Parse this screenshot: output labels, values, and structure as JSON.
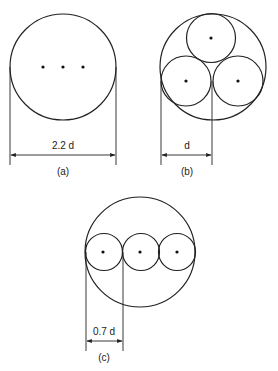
{
  "figure": {
    "panels": [
      {
        "id": "a",
        "caption": "(a)",
        "dimension_label": "2.2 d",
        "description": "Single large circle containing three conductor centre dots in a row"
      },
      {
        "id": "b",
        "caption": "(b)",
        "dimension_label": "d",
        "description": "Outer circle enclosing three touching circles arranged in a triangle"
      },
      {
        "id": "c",
        "caption": "(c)",
        "dimension_label": "0.7 d",
        "description": "Outer circle enclosing three touching circles arranged in a row"
      }
    ]
  }
}
